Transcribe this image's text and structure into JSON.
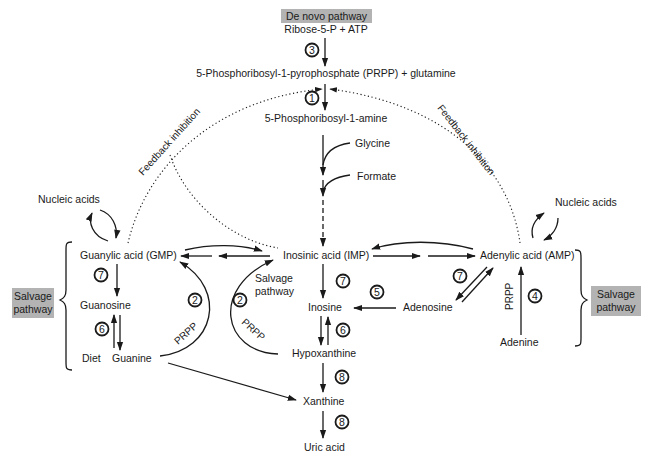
{
  "diagram": {
    "title_box": "De novo pathway",
    "nodes": {
      "ribose": "Ribose-5-P  +  ATP",
      "prpp": "5-Phosphoribosyl-1-pyrophosphate (PRPP)  +  glutamine",
      "amine": "5-Phosphoribosyl-1-amine",
      "glycine": "Glycine",
      "formate": "Formate",
      "imp": "Inosinic acid (IMP)",
      "gmp": "Guanylic acid (GMP)",
      "amp": "Adenylic acid (AMP)",
      "nucleic_left": "Nucleic acids",
      "nucleic_right": "Nucleic acids",
      "guanosine": "Guanosine",
      "guanine": "Guanine",
      "diet": "Diet",
      "inosine": "Inosine",
      "adenosine": "Adenosine",
      "adenine": "Adenine",
      "hypoxanthine": "Hypoxanthine",
      "xanthine": "Xanthine",
      "uric_acid": "Uric acid"
    },
    "labels": {
      "feedback_left": "Feedback inhibition",
      "feedback_right": "Feedback inhibition",
      "salvage_pathway_mid_1": "Salvage",
      "salvage_pathway_mid_2": "pathway",
      "salvage_left_1": "Salvage",
      "salvage_left_2": "pathway",
      "salvage_right_1": "Salvage",
      "salvage_right_2": "pathway",
      "prpp_left": "PRPP",
      "prpp_mid": "PRPP",
      "prpp_right": "PRPP"
    },
    "enzyme_steps": {
      "s3": "3",
      "s1": "1",
      "s7_gmp": "7",
      "s6_guan": "6",
      "s2_left": "2",
      "s2_right": "2",
      "s7_imp": "7",
      "s5": "5",
      "s6_ino": "6",
      "s7_amp": "7",
      "s4": "4",
      "s8_a": "8",
      "s8_b": "8"
    },
    "colors": {
      "line": "#1a1a1a",
      "label_box": "#b3b3b3",
      "background": "#ffffff"
    }
  }
}
